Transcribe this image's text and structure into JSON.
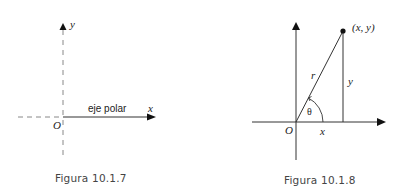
{
  "figures": [
    {
      "id": "fig1",
      "caption": "Figura  10.1.7",
      "labels": {
        "y_axis": "y",
        "x_axis": "x",
        "origin": "O",
        "polar_axis": "eje polar"
      }
    },
    {
      "id": "fig2",
      "caption": "Figura  10.1.8",
      "labels": {
        "point": "(x, y)",
        "radius": "r",
        "y_leg": "y",
        "x_leg": "x",
        "angle": "θ",
        "origin": "O"
      }
    }
  ],
  "colors": {
    "line": "#333333",
    "dashed": "#888888",
    "text": "#222222",
    "caption": "#444444"
  }
}
